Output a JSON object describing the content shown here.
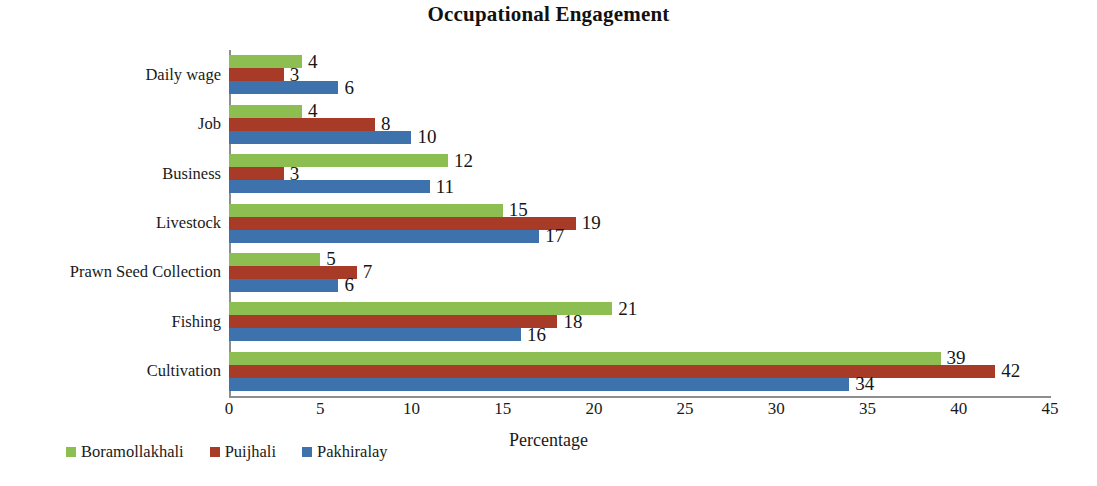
{
  "chart_data": {
    "type": "bar",
    "orientation": "horizontal",
    "title": "Occupational Engagement",
    "xlabel": "Percentage",
    "ylabel": "",
    "xlim": [
      0,
      45
    ],
    "xticks": [
      0,
      5,
      10,
      15,
      20,
      25,
      30,
      35,
      40,
      45
    ],
    "grid": false,
    "legend_position": "bottom-left",
    "categories": [
      "Cultivation",
      "Fishing",
      "Prawn Seed Collection",
      "Livestock",
      "Business",
      "Job",
      "Daily wage"
    ],
    "series": [
      {
        "name": "Boramollakhali",
        "color": "#8DBE52",
        "values": [
          39,
          21,
          5,
          15,
          12,
          4,
          4
        ]
      },
      {
        "name": "Puijhali",
        "color": "#A73B28",
        "values": [
          42,
          18,
          7,
          19,
          3,
          8,
          3
        ]
      },
      {
        "name": "Pakhiralay",
        "color": "#3E72AC",
        "values": [
          34,
          16,
          6,
          17,
          11,
          10,
          6
        ]
      }
    ]
  },
  "axis": {
    "line_color": "#8e8e8e"
  }
}
